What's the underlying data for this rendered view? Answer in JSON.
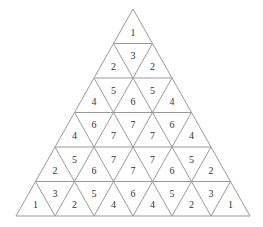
{
  "diagram": {
    "title": "",
    "type": "triangular-number-grid",
    "rows": 6,
    "line_color": "#9a9a9a",
    "text_color": "#333333",
    "cells": [
      [
        "1"
      ],
      [
        "2",
        "3",
        "2"
      ],
      [
        "4",
        "5",
        "6",
        "5",
        "4"
      ],
      [
        "4",
        "6",
        "7",
        "7",
        "7",
        "6",
        "4"
      ],
      [
        "2",
        "5",
        "6",
        "7",
        "7",
        "7",
        "6",
        "5",
        "2"
      ],
      [
        "1",
        "3",
        "2",
        "5",
        "4",
        "6",
        "4",
        "5",
        "2",
        "3",
        "1"
      ]
    ]
  }
}
